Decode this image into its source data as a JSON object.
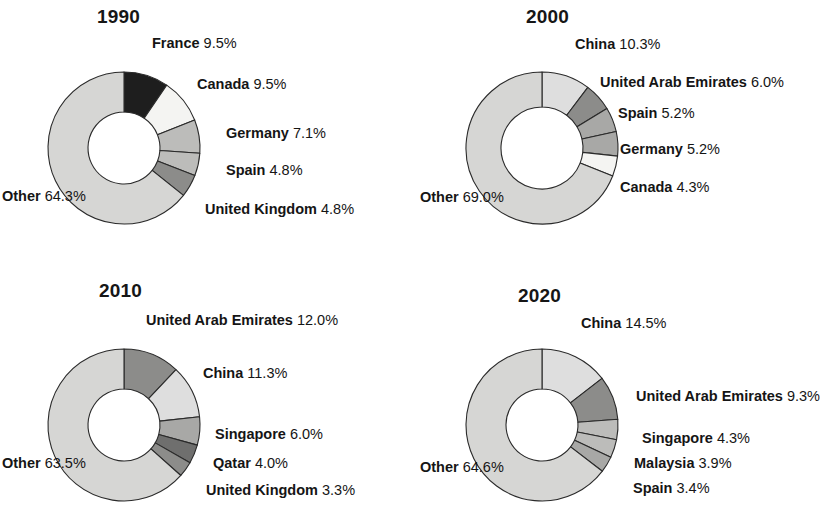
{
  "figure": {
    "type": "donut-pie-grid",
    "panel_count": 4,
    "background": "#ffffff"
  },
  "palette": {
    "near_black": "#1e1e1e",
    "near_white": "#f4f4f2",
    "light_gray": "#d6d6d4",
    "lighter_gray": "#dedede",
    "mid_light_gray": "#bcbcba",
    "mid_gray": "#a8a8a6",
    "dark_gray": "#8c8c8a",
    "darker_gray": "#6f6f6e",
    "outline": "#2a2a2a",
    "hole": "#ffffff"
  },
  "geometry": {
    "center_x": 124,
    "center_y": 148,
    "outer_radius": 76,
    "inner_radius": 36,
    "start_angle_deg": 0
  },
  "chart_data": [
    {
      "type": "pie",
      "title": "1990",
      "donut": true,
      "labels": [
        "France",
        "Canada",
        "Germany",
        "Spain",
        "United Kingdom",
        "Other"
      ],
      "values": [
        9.5,
        9.5,
        7.1,
        4.8,
        4.8,
        64.3
      ],
      "value_texts": [
        "9.5%",
        "9.5%",
        "7.1%",
        "4.8%",
        "4.8%",
        "64.3%"
      ],
      "colors": [
        "#1e1e1e",
        "#f4f4f2",
        "#bcbcba",
        "#bcbcba",
        "#8c8c8a",
        "#d6d6d4"
      ],
      "legend": "labels-outside"
    },
    {
      "type": "pie",
      "title": "2000",
      "donut": true,
      "labels": [
        "China",
        "United Arab Emirates",
        "Spain",
        "Germany",
        "Canada",
        "Other"
      ],
      "values": [
        10.3,
        6.0,
        5.2,
        5.2,
        4.3,
        69.0
      ],
      "value_texts": [
        "10.3%",
        "6.0%",
        "5.2%",
        "5.2%",
        "4.3%",
        "69.0%"
      ],
      "colors": [
        "#dedede",
        "#8c8c8a",
        "#a8a8a6",
        "#a8a8a6",
        "#f4f4f2",
        "#d6d6d4"
      ],
      "legend": "labels-outside"
    },
    {
      "type": "pie",
      "title": "2010",
      "donut": true,
      "labels": [
        "United Arab Emirates",
        "China",
        "Singapore",
        "Qatar",
        "United Kingdom",
        "Other"
      ],
      "values": [
        12.0,
        11.3,
        6.0,
        4.0,
        3.3,
        63.5
      ],
      "value_texts": [
        "12.0%",
        "11.3%",
        "6.0%",
        "4.0%",
        "3.3%",
        "63.5%"
      ],
      "colors": [
        "#8c8c8a",
        "#dedede",
        "#a8a8a6",
        "#6f6f6e",
        "#8c8c8a",
        "#d6d6d4"
      ],
      "legend": "labels-outside"
    },
    {
      "type": "pie",
      "title": "2020",
      "donut": true,
      "labels": [
        "China",
        "United Arab Emirates",
        "Singapore",
        "Malaysia",
        "Spain",
        "Other"
      ],
      "values": [
        14.5,
        9.3,
        4.3,
        3.9,
        3.4,
        64.6
      ],
      "value_texts": [
        "14.5%",
        "9.3%",
        "4.3%",
        "3.9%",
        "3.4%",
        "64.6%"
      ],
      "colors": [
        "#dedede",
        "#8c8c8a",
        "#bcbcba",
        "#bcbcba",
        "#a8a8a6",
        "#d6d6d4"
      ],
      "legend": "labels-outside"
    }
  ],
  "panels": [
    {
      "title": "1990",
      "title_pos": {
        "x": 97,
        "y": 6
      },
      "labels": [
        {
          "name": "France",
          "pct": "9.5%",
          "x": 152,
          "y": 36,
          "align": "left"
        },
        {
          "name": "Canada",
          "pct": "9.5%",
          "x": 197,
          "y": 77,
          "align": "left"
        },
        {
          "name": "Germany",
          "pct": "7.1%",
          "x": 226,
          "y": 126,
          "align": "left"
        },
        {
          "name": "Spain",
          "pct": "4.8%",
          "x": 226,
          "y": 163,
          "align": "left"
        },
        {
          "name": "United Kingdom",
          "pct": "4.8%",
          "x": 205,
          "y": 202,
          "align": "left"
        },
        {
          "name": "Other",
          "pct": "64.3%",
          "x": 2,
          "y": 189,
          "align": "left"
        }
      ]
    },
    {
      "title": "2000",
      "title_pos": {
        "x": 108,
        "y": 6
      },
      "labels": [
        {
          "name": "China",
          "pct": "10.3%",
          "x": 157,
          "y": 37,
          "align": "left"
        },
        {
          "name": "United Arab Emirates",
          "pct": "6.0%",
          "x": 182,
          "y": 75,
          "align": "left"
        },
        {
          "name": "Spain",
          "pct": "5.2%",
          "x": 200,
          "y": 106,
          "align": "left"
        },
        {
          "name": "Germany",
          "pct": "5.2%",
          "x": 202,
          "y": 142,
          "align": "left"
        },
        {
          "name": "Canada",
          "pct": "4.3%",
          "x": 202,
          "y": 180,
          "align": "left"
        },
        {
          "name": "Other",
          "pct": "69.0%",
          "x": 2,
          "y": 190,
          "align": "left"
        }
      ]
    },
    {
      "title": "2010",
      "title_pos": {
        "x": 99,
        "y": 17
      },
      "labels": [
        {
          "name": "United Arab Emirates",
          "pct": "12.0%",
          "x": 146,
          "y": 50,
          "align": "left"
        },
        {
          "name": "China",
          "pct": "11.3%",
          "x": 203,
          "y": 103,
          "align": "left"
        },
        {
          "name": "Singapore",
          "pct": "6.0%",
          "x": 215,
          "y": 164,
          "align": "left"
        },
        {
          "name": "Qatar",
          "pct": "4.0%",
          "x": 213,
          "y": 193,
          "align": "left"
        },
        {
          "name": "United Kingdom",
          "pct": "3.3%",
          "x": 206,
          "y": 220,
          "align": "left"
        },
        {
          "name": "Other",
          "pct": "63.5%",
          "x": 2,
          "y": 193,
          "align": "left"
        }
      ]
    },
    {
      "title": "2020",
      "title_pos": {
        "x": 100,
        "y": 22
      },
      "labels": [
        {
          "name": "China",
          "pct": "14.5%",
          "x": 163,
          "y": 53,
          "align": "left"
        },
        {
          "name": "United Arab Emirates",
          "pct": "9.3%",
          "x": 218,
          "y": 126,
          "align": "left"
        },
        {
          "name": "Singapore",
          "pct": "4.3%",
          "x": 224,
          "y": 168,
          "align": "left"
        },
        {
          "name": "Malaysia",
          "pct": "3.9%",
          "x": 216,
          "y": 193,
          "align": "left"
        },
        {
          "name": "Spain",
          "pct": "3.4%",
          "x": 215,
          "y": 218,
          "align": "left"
        },
        {
          "name": "Other",
          "pct": "64.6%",
          "x": 2,
          "y": 197,
          "align": "left"
        }
      ]
    }
  ]
}
